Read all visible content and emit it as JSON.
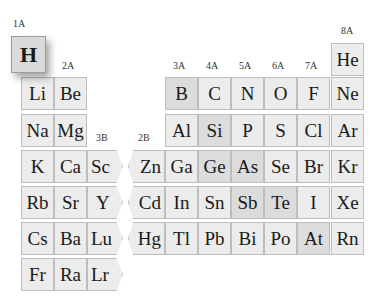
{
  "groups": [
    {
      "label": "1A",
      "x": 13,
      "y": 18
    },
    {
      "label": "2A",
      "x": 62,
      "y": 60
    },
    {
      "label": "3B",
      "x": 96,
      "y": 132
    },
    {
      "label": "2B",
      "x": 138,
      "y": 132
    },
    {
      "label": "3A",
      "x": 173,
      "y": 60
    },
    {
      "label": "4A",
      "x": 206,
      "y": 60
    },
    {
      "label": "5A",
      "x": 239,
      "y": 60
    },
    {
      "label": "6A",
      "x": 272,
      "y": 60
    },
    {
      "label": "7A",
      "x": 305,
      "y": 60
    },
    {
      "label": "8A",
      "x": 341,
      "y": 25
    }
  ],
  "elements": {
    "H": "H",
    "He": "He",
    "Li": "Li",
    "Be": "Be",
    "B": "B",
    "C": "C",
    "N": "N",
    "O": "O",
    "F": "F",
    "Ne": "Ne",
    "Na": "Na",
    "Mg": "Mg",
    "Al": "Al",
    "Si": "Si",
    "P": "P",
    "S": "S",
    "Cl": "Cl",
    "Ar": "Ar",
    "K": "K",
    "Ca": "Ca",
    "Sc": "Sc",
    "Zn": "Zn",
    "Ga": "Ga",
    "Ge": "Ge",
    "As": "As",
    "Se": "Se",
    "Br": "Br",
    "Kr": "Kr",
    "Rb": "Rb",
    "Sr": "Sr",
    "Y": "Y",
    "Cd": "Cd",
    "In": "In",
    "Sn": "Sn",
    "Sb": "Sb",
    "Te": "Te",
    "I": "I",
    "Xe": "Xe",
    "Cs": "Cs",
    "Ba": "Ba",
    "Lu": "Lu",
    "Hg": "Hg",
    "Tl": "Tl",
    "Pb": "Pb",
    "Bi": "Bi",
    "Po": "Po",
    "At": "At",
    "Rn": "Rn",
    "Fr": "Fr",
    "Ra": "Ra",
    "Lr": "Lr"
  },
  "highlighted": [
    "H"
  ],
  "shaded": [
    "B",
    "Si",
    "Ge",
    "As",
    "Sb",
    "Te",
    "At"
  ]
}
